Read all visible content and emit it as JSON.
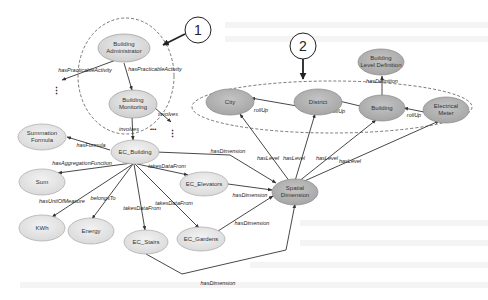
{
  "diagram": {
    "title": "",
    "callouts": [
      {
        "id": "c1",
        "label": "1",
        "x": 198,
        "y": 30
      },
      {
        "id": "c2",
        "label": "2",
        "x": 303,
        "y": 46
      }
    ],
    "nodes": {
      "building_administrator": {
        "line1": "Building",
        "line2": "Administrator",
        "shade": "light"
      },
      "building_monitoring": {
        "line1": "Building",
        "line2": "Monitoring",
        "shade": "light"
      },
      "summation_formula": {
        "line1": "Summation",
        "line2": "Formula",
        "shade": "pale"
      },
      "ec_building": {
        "label": "EC_Building",
        "shade": "pale"
      },
      "sum": {
        "label": "Sum",
        "shade": "pale"
      },
      "ec_elevators": {
        "label": "EC_Elevators",
        "shade": "pale"
      },
      "kwh": {
        "label": "KWh",
        "shade": "pale"
      },
      "energy": {
        "label": "Energy",
        "shade": "pale"
      },
      "ec_stairs": {
        "label": "EC_Stairs",
        "shade": "pale"
      },
      "ec_gardens": {
        "label": "EC_Gardens",
        "shade": "pale"
      },
      "spatial_dimension": {
        "line1": "Spatial",
        "line2": "Dimension",
        "shade": "dark"
      },
      "city": {
        "label": "City",
        "shade": "dark"
      },
      "district": {
        "label": "District",
        "shade": "dark"
      },
      "building": {
        "label": "Building",
        "shade": "dark"
      },
      "building_level_definition": {
        "line1": "Building",
        "line2": "Level Definition",
        "shade": "dark"
      },
      "electrical_meter": {
        "line1": "Electrical",
        "line2": "Meter",
        "shade": "dark"
      }
    },
    "edges": {
      "hasPracticableActivity_left": "hasPracticableActivity",
      "hasPracticableActivity_down": "hasPracticableActivity",
      "involves_right": "involves",
      "involves_down": "involves",
      "hasFormula": "hasFormula",
      "hasAggregationFunction": "hasAggregationFunction",
      "hasUnitOfMeasure": "hasUnitOfMeasure",
      "belongsTo": "belongsTo",
      "takesDataFrom_stairs": "takesDataFrom",
      "takesDataFrom_gardens": "takesDataFrom",
      "takesDataFrom_elevators": "takesDataFrom",
      "hasDimension_building": "hasDimension",
      "hasDimension_elevators": "hasDimension",
      "hasDimension_gardens": "hasDimension",
      "hasDimension_stairs": "hasDimension",
      "hasLevel_city": "hasLevel",
      "hasLevel_district": "hasLevel",
      "hasLevel_building": "hasLevel",
      "hasLevel_meter": "hasLevel",
      "rollUp_district_city": "rollUp",
      "rollUp_building_district": "rollUp",
      "rollUp_meter_building": "rollUp",
      "hasDefinition": "hasDefinition"
    },
    "continuation_marker": "⋮",
    "ellipsis_marker": "•••",
    "colors": {
      "node_light": "#dcdcdc",
      "node_pale": "#e6e6e6",
      "node_dark": "#b4b4b4",
      "node_stroke": "#9a9a9a",
      "edge": "#333333",
      "dashed_group": "#555555"
    }
  }
}
